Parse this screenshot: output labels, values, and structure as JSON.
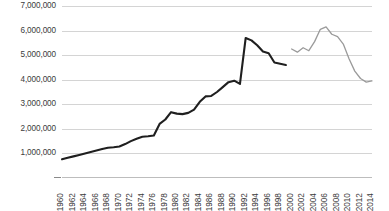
{
  "chart_data": {
    "type": "line",
    "title": "",
    "subtitle": "",
    "xlabel": "",
    "ylabel": "",
    "grid": true,
    "legend_position": "none",
    "ylim": [
      0,
      7000000
    ],
    "xlim": [
      1960,
      2014
    ],
    "y_ticks": [
      1000000,
      2000000,
      3000000,
      4000000,
      5000000,
      6000000,
      7000000
    ],
    "y_tick_labels": [
      "1,000,000",
      "2,000,000",
      "3,000,000",
      "4,000,000",
      "5,000,000",
      "6,000,000",
      "7,000,000"
    ],
    "x_ticks": [
      1960,
      1962,
      1964,
      1966,
      1968,
      1970,
      1972,
      1974,
      1976,
      1978,
      1980,
      1982,
      1984,
      1986,
      1988,
      1990,
      1992,
      1994,
      1996,
      1998,
      2000,
      2002,
      2004,
      2006,
      2008,
      2010,
      2012,
      2014
    ],
    "x_tick_labels": [
      "1960",
      "1962",
      "1964",
      "1966",
      "1968",
      "1970",
      "1972",
      "1974",
      "1976",
      "1978",
      "1980",
      "1982",
      "1984",
      "1986",
      "1988",
      "1990",
      "1992",
      "1994",
      "1996",
      "1998",
      "2000",
      "2002",
      "2004",
      "2006",
      "2008",
      "2010",
      "2012",
      "2014"
    ],
    "series": [
      {
        "name": "series-1",
        "color": "#1f1f1f",
        "width": 2.1,
        "x": [
          1960,
          1961,
          1962,
          1963,
          1964,
          1965,
          1966,
          1967,
          1968,
          1969,
          1970,
          1971,
          1972,
          1973,
          1974,
          1975,
          1976,
          1977,
          1978,
          1979,
          1980,
          1981,
          1982,
          1983,
          1984,
          1985,
          1986,
          1987,
          1988,
          1989,
          1990,
          1991,
          1992,
          1993,
          1994,
          1995,
          1996,
          1997,
          1998,
          1999
        ],
        "values": [
          760000,
          820000,
          880000,
          940000,
          1000000,
          1060000,
          1120000,
          1180000,
          1230000,
          1250000,
          1280000,
          1380000,
          1500000,
          1600000,
          1680000,
          1700000,
          1730000,
          2200000,
          2380000,
          2680000,
          2620000,
          2600000,
          2650000,
          2780000,
          3100000,
          3320000,
          3340000,
          3500000,
          3700000,
          3900000,
          3960000,
          3830000,
          3800000,
          4250000,
          5000000,
          5500000,
          5700000,
          5680000,
          5500000,
          5300000
        ]
      },
      {
        "name": "series-2",
        "color": "#9a9a9a",
        "width": 1.3,
        "x": [
          2000,
          2001,
          2002,
          2003,
          2004,
          2005,
          2006,
          2007,
          2008,
          2009,
          2010,
          2011,
          2012,
          2013,
          2014
        ],
        "values": [
          5250000,
          5120000,
          5300000,
          5180000,
          5550000,
          6050000,
          6150000,
          5850000,
          5750000,
          5450000,
          4850000,
          4350000,
          4050000,
          3900000,
          3950000
        ]
      }
    ],
    "series_extra": [
      {
        "name": "series-1-tail",
        "note": "dark line decline from peak to end",
        "x": [
          1992,
          1993,
          1994,
          1995,
          1996,
          1997,
          1998,
          1999
        ],
        "values": [
          5700000,
          5600000,
          5400000,
          5150000,
          5080000,
          4700000,
          4650000,
          4600000
        ]
      }
    ]
  }
}
